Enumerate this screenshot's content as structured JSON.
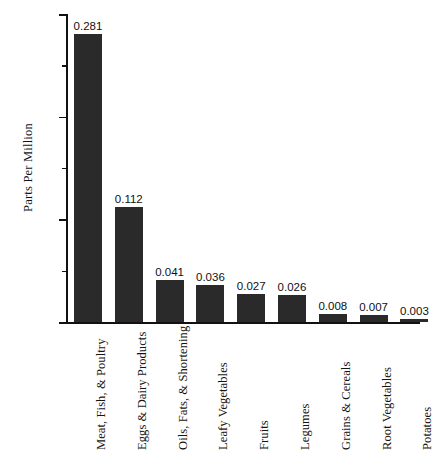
{
  "chart_data": {
    "type": "bar",
    "title": "",
    "subtitle": "",
    "xlabel": "",
    "ylabel": "Parts Per Million",
    "ylim": [
      0.0,
      0.3
    ],
    "ytick_labels": [
      "0.000",
      "0.100",
      "0.200",
      "0.300"
    ],
    "ytick_values": [
      0.0,
      0.1,
      0.2,
      0.3
    ],
    "minor_tick_values": [
      0.05,
      0.15,
      0.25
    ],
    "grid": false,
    "legend": null,
    "bar_color": "#2a2a2a",
    "axis_color": "#111111",
    "background_color": "#ffffff",
    "categories": [
      "Meat, Fish, & Poultry",
      "Eggs & Dairy Products",
      "Oils, Fats, & Shortening",
      "Leafy Vegetables",
      "Fruits",
      "Legumes",
      "Grains & Cereals",
      "Root Vegetables",
      "Potatoes"
    ],
    "values": [
      0.281,
      0.112,
      0.041,
      0.036,
      0.027,
      0.026,
      0.008,
      0.007,
      0.003
    ],
    "value_labels": [
      "0.281",
      "0.112",
      "0.041",
      "0.036",
      "0.027",
      "0.026",
      "0.008",
      "0.007",
      "0.003"
    ]
  }
}
